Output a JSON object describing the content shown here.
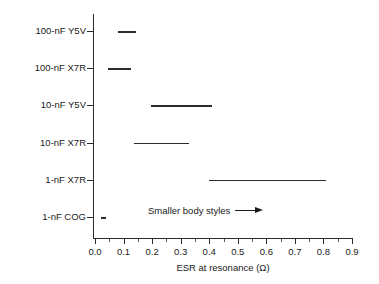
{
  "chart_data": {
    "type": "bar",
    "title": "",
    "subtitle": "",
    "xlabel": "ESR at resonance (Ω)",
    "ylabel": "",
    "xlim": [
      0.0,
      0.9
    ],
    "xticks": [
      "0.0",
      "0.1",
      "0.2",
      "0.3",
      "0.4",
      "0.5",
      "0.6",
      "0.7",
      "0.8",
      "0.9"
    ],
    "xtick_values": [
      0.0,
      0.1,
      0.2,
      0.3,
      0.4,
      0.5,
      0.6,
      0.7,
      0.8,
      0.9
    ],
    "minor_ticks": true,
    "grid": false,
    "legend": "none",
    "orientation": "horizontal",
    "categories": [
      "100-nF Y5V",
      "100-nF X7R",
      "10-nF Y5V",
      "10-nF X7R",
      "1-nF X7R",
      "1-nF COG"
    ],
    "ranges": [
      {
        "label": "100-nF Y5V",
        "low": 0.08,
        "high": 0.145
      },
      {
        "label": "100-nF X7R",
        "low": 0.045,
        "high": 0.125
      },
      {
        "label": "10-nF Y5V",
        "low": 0.195,
        "high": 0.41
      },
      {
        "label": "10-nF X7R",
        "low": 0.135,
        "high": 0.33
      },
      {
        "label": "1-nF X7R",
        "low": 0.4,
        "high": 0.81
      },
      {
        "label": "1-nF COG",
        "low": 0.02,
        "high": 0.04
      }
    ],
    "annotations": [
      {
        "text": "Smaller body styles",
        "icon": "right-arrow"
      }
    ],
    "colors": {
      "axis": "#2b2b2b",
      "segment": "#2b2b2b",
      "text": "#1a1a1a",
      "background": "#ffffff"
    }
  }
}
